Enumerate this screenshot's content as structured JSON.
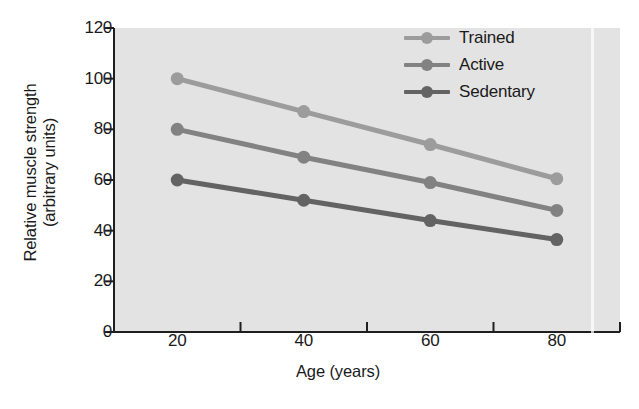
{
  "chart_data": {
    "type": "line",
    "title": "",
    "xlabel": "Age (years)",
    "ylabel": "Relative muscle strength (arbitrary units)",
    "ylabel_line1": "Relative muscle strength",
    "ylabel_line2": "(arbitrary units)",
    "x": [
      20,
      40,
      60,
      80
    ],
    "xticks": [
      "20",
      "40",
      "60",
      "80"
    ],
    "yticks": [
      "0",
      "20",
      "40",
      "60",
      "80",
      "100",
      "120"
    ],
    "xlim": [
      10,
      90
    ],
    "ylim": [
      0,
      120
    ],
    "grid": false,
    "legend_position": "top-right",
    "series": [
      {
        "name": "Trained",
        "values": [
          100,
          87,
          74,
          60.5
        ],
        "color": "#9c9c9c"
      },
      {
        "name": "Active",
        "values": [
          80,
          69,
          59,
          48
        ],
        "color": "#828282"
      },
      {
        "name": "Sedentary",
        "values": [
          60,
          52,
          44,
          36.5
        ],
        "color": "#636363"
      }
    ]
  },
  "style": {
    "plot_background": "#e3e3e3",
    "axis_color": "#1f1f1f",
    "text_color": "#1a1a1a"
  }
}
